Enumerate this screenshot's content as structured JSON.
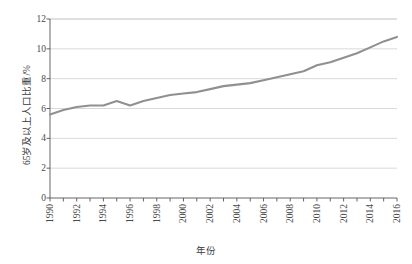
{
  "chart_data": {
    "type": "line",
    "title": "",
    "xlabel": "年份",
    "ylabel": "65岁及以上人口比重/%",
    "xlim": [
      1990,
      2016
    ],
    "ylim": [
      0,
      12
    ],
    "yticks": [
      0,
      2,
      4,
      6,
      8,
      10,
      12
    ],
    "xticks_major": [
      1990,
      1992,
      1994,
      1996,
      1998,
      2000,
      2002,
      2004,
      2006,
      2008,
      2010,
      2012,
      2014,
      2016
    ],
    "grid": "horizontal",
    "legend": "none",
    "line_color": "#909090",
    "axis_color": "#555555",
    "grid_color": "#c8c8c8",
    "x": [
      1990,
      1991,
      1992,
      1993,
      1994,
      1995,
      1996,
      1997,
      1998,
      1999,
      2000,
      2001,
      2002,
      2003,
      2004,
      2005,
      2006,
      2007,
      2008,
      2009,
      2010,
      2011,
      2012,
      2013,
      2014,
      2015,
      2016
    ],
    "values": [
      5.6,
      5.9,
      6.1,
      6.2,
      6.2,
      6.5,
      6.2,
      6.5,
      6.7,
      6.9,
      7.0,
      7.1,
      7.3,
      7.5,
      7.6,
      7.7,
      7.9,
      8.1,
      8.3,
      8.5,
      8.9,
      9.1,
      9.4,
      9.7,
      10.1,
      10.5,
      10.8
    ],
    "series_name": "65岁及以上人口比重"
  }
}
